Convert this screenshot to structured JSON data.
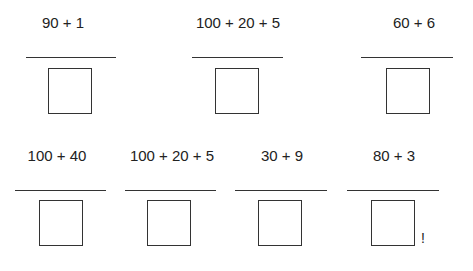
{
  "problems": [
    {
      "expression": "90 + 1",
      "cx": 63,
      "ty": 14,
      "lx": 26,
      "lw": 90,
      "ly": 57,
      "bx": 48,
      "by": 68
    },
    {
      "expression": "100 + 20 + 5",
      "cx": 238,
      "ty": 14,
      "lx": 192,
      "lw": 91,
      "ly": 57,
      "bx": 215,
      "by": 68
    },
    {
      "expression": "60 + 6",
      "cx": 414,
      "ty": 14,
      "lx": 361,
      "lw": 92,
      "ly": 57,
      "bx": 386,
      "by": 68
    },
    {
      "expression": "100 + 40",
      "cx": 57,
      "ty": 147,
      "lx": 15,
      "lw": 91,
      "ly": 190,
      "bx": 39,
      "by": 200
    },
    {
      "expression": "100 + 20 + 5",
      "cx": 172,
      "ty": 147,
      "lx": 125,
      "lw": 91,
      "ly": 190,
      "bx": 147,
      "by": 200
    },
    {
      "expression": "30 + 9",
      "cx": 282,
      "ty": 147,
      "lx": 235,
      "lw": 92,
      "ly": 190,
      "bx": 258,
      "by": 200
    },
    {
      "expression": "80 + 3",
      "cx": 394,
      "ty": 147,
      "lx": 347,
      "lw": 92,
      "ly": 190,
      "bx": 371,
      "by": 200
    }
  ],
  "annotation": {
    "text": "!",
    "x": 421,
    "y": 230
  }
}
